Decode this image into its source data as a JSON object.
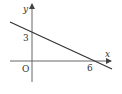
{
  "diagram": {
    "type": "coordinate-plane-line",
    "axes": {
      "x_label": "x",
      "y_label": "y",
      "origin_label": "O"
    },
    "line": {
      "y_intercept": 3,
      "x_intercept": 6,
      "y_intercept_label": "3",
      "x_intercept_label": "6"
    },
    "colors": {
      "axis": "#555555",
      "line": "#333333",
      "text": "#333333"
    }
  }
}
